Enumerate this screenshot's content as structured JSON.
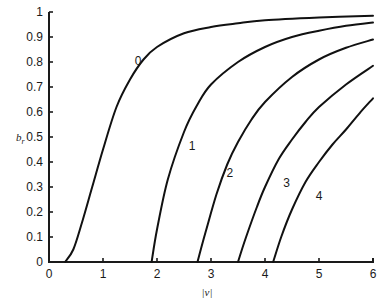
{
  "chart_data": {
    "type": "line",
    "title": "",
    "xlabel": "|ν|",
    "ylabel": "b_r",
    "xlim": [
      0,
      6
    ],
    "ylim": [
      0,
      1
    ],
    "grid": false,
    "legend": "inline curve labels",
    "x_ticks": [
      "0",
      "1",
      "2",
      "3",
      "4",
      "5",
      "6"
    ],
    "y_ticks": [
      "0",
      "0.1",
      "0.2",
      "0.3",
      "0.4",
      "0.5",
      "0.6",
      "0.7",
      "0.8",
      "0.9",
      "1"
    ],
    "series": [
      {
        "name": "0",
        "label_pos": [
          1.65,
          0.79
        ],
        "points": [
          [
            0.3,
            0
          ],
          [
            0.45,
            0.05
          ],
          [
            0.6,
            0.15
          ],
          [
            0.8,
            0.3
          ],
          [
            1.0,
            0.45
          ],
          [
            1.25,
            0.62
          ],
          [
            1.5,
            0.73
          ],
          [
            1.75,
            0.81
          ],
          [
            2.0,
            0.86
          ],
          [
            2.5,
            0.915
          ],
          [
            3.0,
            0.94
          ],
          [
            3.5,
            0.955
          ],
          [
            4.0,
            0.967
          ],
          [
            5.0,
            0.978
          ],
          [
            6.0,
            0.985
          ]
        ]
      },
      {
        "name": "1",
        "label_pos": [
          2.65,
          0.45
        ],
        "points": [
          [
            1.9,
            0
          ],
          [
            2.0,
            0.13
          ],
          [
            2.2,
            0.33
          ],
          [
            2.5,
            0.52
          ],
          [
            2.75,
            0.63
          ],
          [
            3.0,
            0.71
          ],
          [
            3.5,
            0.8
          ],
          [
            4.0,
            0.86
          ],
          [
            4.5,
            0.9
          ],
          [
            5.0,
            0.925
          ],
          [
            5.5,
            0.945
          ],
          [
            6.0,
            0.958
          ]
        ]
      },
      {
        "name": "2",
        "label_pos": [
          3.35,
          0.34
        ],
        "points": [
          [
            2.75,
            0
          ],
          [
            2.9,
            0.12
          ],
          [
            3.1,
            0.27
          ],
          [
            3.3,
            0.39
          ],
          [
            3.5,
            0.48
          ],
          [
            3.75,
            0.57
          ],
          [
            4.0,
            0.64
          ],
          [
            4.5,
            0.74
          ],
          [
            5.0,
            0.81
          ],
          [
            5.5,
            0.857
          ],
          [
            6.0,
            0.89
          ]
        ]
      },
      {
        "name": "3",
        "label_pos": [
          4.4,
          0.3
        ],
        "points": [
          [
            3.5,
            0
          ],
          [
            3.65,
            0.1
          ],
          [
            3.85,
            0.22
          ],
          [
            4.0,
            0.3
          ],
          [
            4.25,
            0.41
          ],
          [
            4.5,
            0.49
          ],
          [
            4.75,
            0.56
          ],
          [
            5.0,
            0.62
          ],
          [
            5.5,
            0.71
          ],
          [
            6.0,
            0.785
          ]
        ]
      },
      {
        "name": "4",
        "label_pos": [
          5.0,
          0.25
        ],
        "points": [
          [
            4.15,
            0
          ],
          [
            4.3,
            0.1
          ],
          [
            4.5,
            0.21
          ],
          [
            4.75,
            0.32
          ],
          [
            5.0,
            0.4
          ],
          [
            5.25,
            0.47
          ],
          [
            5.5,
            0.53
          ],
          [
            5.75,
            0.595
          ],
          [
            6.0,
            0.655
          ]
        ]
      }
    ]
  },
  "labels": {
    "xlabel": "|ν|",
    "ylabel_main": "b",
    "ylabel_sub": "r"
  }
}
